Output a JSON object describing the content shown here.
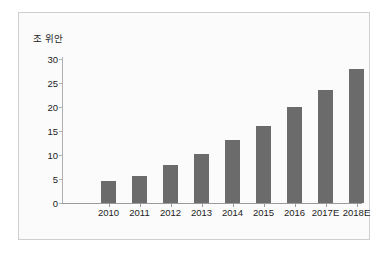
{
  "chart_data": {
    "type": "bar",
    "title": "",
    "subtitle": "",
    "xlabel": "",
    "ylabel": "조 위안",
    "ylim": [
      0,
      30
    ],
    "yticks": [
      0,
      5,
      10,
      15,
      20,
      25,
      30
    ],
    "ytick_labels": [
      "0",
      "5",
      "10",
      "15",
      "20",
      "25",
      "30"
    ],
    "grid": false,
    "legend": false,
    "legend_position": "none",
    "bar_color": "#6b6b6b",
    "categories": [
      "2010",
      "2011",
      "2012",
      "2013",
      "2014",
      "2015",
      "2016",
      "2017E",
      "2018E"
    ],
    "values": [
      4.5,
      5.7,
      8.0,
      10.2,
      13.2,
      16.1,
      20.0,
      23.6,
      28.0
    ]
  },
  "figure": {
    "border_color": "#cfcfcf",
    "background_color": "#fbfbfb",
    "axis_color": "#9a9a9a",
    "text_color": "#1d1d1d"
  }
}
